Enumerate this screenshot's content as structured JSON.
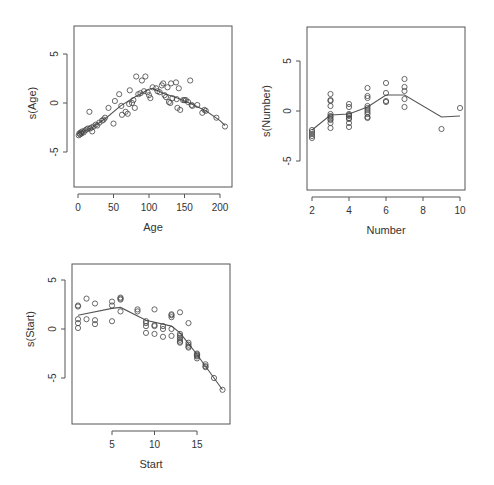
{
  "figure": {
    "title": "",
    "layout": "2x2 grid of GAM partial-effect plots (bottom-right panel empty)"
  },
  "chart_data": [
    {
      "type": "scatter",
      "panel": "top-left",
      "title": "",
      "xlabel": "Age",
      "ylabel": "s(Age)",
      "xlim": [
        -8,
        214
      ],
      "ylim": [
        -8.5,
        7.8
      ],
      "xticks": [
        0,
        50,
        100,
        150,
        200
      ],
      "xtick_labels": [
        "0",
        "50",
        "100",
        "150",
        "200"
      ],
      "yticks": [
        -5,
        0,
        5
      ],
      "ytick_labels": [
        "-5",
        "0",
        "5"
      ],
      "grid": false,
      "legend": null,
      "points": [
        [
          1,
          -3.3
        ],
        [
          2,
          -3.1
        ],
        [
          3,
          -3.2
        ],
        [
          4,
          -3.0
        ],
        [
          5,
          -3.1
        ],
        [
          6,
          -2.9
        ],
        [
          8,
          -3.0
        ],
        [
          10,
          -2.8
        ],
        [
          12,
          -2.7
        ],
        [
          14,
          -2.6
        ],
        [
          16,
          -0.9
        ],
        [
          17,
          -2.6
        ],
        [
          19,
          -2.5
        ],
        [
          20,
          -2.9
        ],
        [
          22,
          -2.4
        ],
        [
          25,
          -2.2
        ],
        [
          27,
          -2.3
        ],
        [
          30,
          -2.0
        ],
        [
          34,
          -1.8
        ],
        [
          36,
          -1.7
        ],
        [
          38,
          -1.5
        ],
        [
          43,
          -0.5
        ],
        [
          50,
          -2.1
        ],
        [
          52,
          0.2
        ],
        [
          58,
          0.9
        ],
        [
          61,
          -0.3
        ],
        [
          62,
          -1.2
        ],
        [
          67,
          -0.9
        ],
        [
          70,
          -1.1
        ],
        [
          72,
          -0.1
        ],
        [
          73,
          1.3
        ],
        [
          76,
          0.0
        ],
        [
          78,
          0.3
        ],
        [
          80,
          -0.5
        ],
        [
          82,
          2.7
        ],
        [
          85,
          0.9
        ],
        [
          88,
          1.0
        ],
        [
          90,
          2.3
        ],
        [
          93,
          1.2
        ],
        [
          95,
          2.7
        ],
        [
          98,
          1.1
        ],
        [
          100,
          0.8
        ],
        [
          102,
          0.5
        ],
        [
          105,
          1.6
        ],
        [
          110,
          1.5
        ],
        [
          112,
          1.2
        ],
        [
          115,
          1.1
        ],
        [
          118,
          1.8
        ],
        [
          120,
          2.0
        ],
        [
          122,
          0.8
        ],
        [
          124,
          0.6
        ],
        [
          126,
          1.6
        ],
        [
          128,
          0.1
        ],
        [
          130,
          0.0
        ],
        [
          131,
          2.0
        ],
        [
          133,
          0.5
        ],
        [
          138,
          2.1
        ],
        [
          139,
          0.4
        ],
        [
          140,
          -0.5
        ],
        [
          142,
          1.5
        ],
        [
          144,
          -0.7
        ],
        [
          148,
          0.3
        ],
        [
          150,
          0.3
        ],
        [
          152,
          0.3
        ],
        [
          155,
          0.1
        ],
        [
          158,
          2.3
        ],
        [
          160,
          -0.2
        ],
        [
          161,
          -0.3
        ],
        [
          168,
          -0.2
        ],
        [
          175,
          -1.0
        ],
        [
          178,
          -0.7
        ],
        [
          180,
          -0.8
        ],
        [
          195,
          -1.5
        ],
        [
          207,
          -2.4
        ]
      ],
      "smooth_curve": {
        "x": [
          0,
          20,
          40,
          60,
          80,
          100,
          105,
          120,
          140,
          160,
          180,
          200,
          207
        ],
        "y": [
          -3.1,
          -2.5,
          -1.5,
          -0.3,
          0.6,
          1.4,
          1.5,
          1.0,
          0.5,
          -0.1,
          -0.8,
          -1.8,
          -2.3
        ]
      }
    },
    {
      "type": "scatter",
      "panel": "top-right",
      "title": "",
      "xlabel": "Number",
      "ylabel": "s(Number)",
      "xlim": [
        1.7,
        10.3
      ],
      "ylim": [
        -8.0,
        8.2
      ],
      "xticks": [
        2,
        4,
        6,
        8,
        10
      ],
      "xtick_labels": [
        "2",
        "4",
        "6",
        "8",
        "10"
      ],
      "yticks": [
        -5,
        0,
        5
      ],
      "ytick_labels": [
        "-5",
        "0",
        "5"
      ],
      "grid": false,
      "legend": null,
      "points": [
        [
          2,
          -1.9
        ],
        [
          2,
          -2.1
        ],
        [
          2,
          -2.3
        ],
        [
          2,
          -2.5
        ],
        [
          2,
          -2.7
        ],
        [
          3,
          1.7
        ],
        [
          3,
          1.1
        ],
        [
          3,
          1.0
        ],
        [
          3,
          0.5
        ],
        [
          3,
          -0.3
        ],
        [
          3,
          -0.5
        ],
        [
          3,
          -0.6
        ],
        [
          3,
          -0.8
        ],
        [
          3,
          -0.9
        ],
        [
          3,
          -1.2
        ],
        [
          3,
          -1.7
        ],
        [
          4,
          0.7
        ],
        [
          4,
          0.4
        ],
        [
          4,
          -0.3
        ],
        [
          4,
          -0.4
        ],
        [
          4,
          -0.5
        ],
        [
          4,
          -0.7
        ],
        [
          4,
          -0.8
        ],
        [
          4,
          -1.2
        ],
        [
          4,
          -1.6
        ],
        [
          5,
          2.3
        ],
        [
          5,
          1.5
        ],
        [
          5,
          1.3
        ],
        [
          5,
          0.5
        ],
        [
          5,
          0.3
        ],
        [
          5,
          0.1
        ],
        [
          5,
          -0.1
        ],
        [
          5,
          -0.3
        ],
        [
          5,
          -0.6
        ],
        [
          5,
          -0.7
        ],
        [
          6,
          2.8
        ],
        [
          6,
          1.8
        ],
        [
          6,
          1.0
        ],
        [
          6,
          0.9
        ],
        [
          7,
          3.2
        ],
        [
          7,
          2.4
        ],
        [
          7,
          2.0
        ],
        [
          7,
          1.2
        ],
        [
          7,
          0.4
        ],
        [
          9,
          -1.8
        ],
        [
          10,
          0.3
        ]
      ],
      "smooth_curve": {
        "x": [
          2,
          3,
          4,
          5,
          6,
          7,
          9,
          10
        ],
        "y": [
          -1.9,
          -0.4,
          -0.3,
          0.4,
          1.6,
          1.6,
          -0.6,
          -0.5
        ]
      }
    },
    {
      "type": "scatter",
      "panel": "bottom-left",
      "title": "",
      "xlabel": "Start",
      "ylabel": "s(Start)",
      "xlim": [
        0.3,
        19.0
      ],
      "ylim": [
        -9.6,
        6.6
      ],
      "xticks": [
        5,
        10,
        15
      ],
      "xtick_labels": [
        "5",
        "10",
        "15"
      ],
      "yticks": [
        -5,
        0,
        5
      ],
      "ytick_labels": [
        "-5",
        "0",
        "5"
      ],
      "grid": false,
      "legend": null,
      "points": [
        [
          1,
          2.4
        ],
        [
          1,
          2.3
        ],
        [
          1,
          1.0
        ],
        [
          1,
          0.6
        ],
        [
          1,
          0.1
        ],
        [
          2,
          3.1
        ],
        [
          2,
          1.0
        ],
        [
          3,
          2.6
        ],
        [
          3,
          0.9
        ],
        [
          3,
          0.5
        ],
        [
          5,
          2.8
        ],
        [
          5,
          2.4
        ],
        [
          5,
          0.8
        ],
        [
          6,
          3.2
        ],
        [
          6,
          3.1
        ],
        [
          6,
          3.0
        ],
        [
          6,
          1.8
        ],
        [
          8,
          2.0
        ],
        [
          8,
          1.8
        ],
        [
          9,
          0.8
        ],
        [
          9,
          0.6
        ],
        [
          9,
          0.3
        ],
        [
          9,
          -0.4
        ],
        [
          10,
          2.0
        ],
        [
          10,
          0.4
        ],
        [
          10,
          0.3
        ],
        [
          10,
          -0.5
        ],
        [
          11,
          0.3
        ],
        [
          11,
          0.0
        ],
        [
          11,
          -0.8
        ],
        [
          12,
          1.5
        ],
        [
          12,
          1.4
        ],
        [
          12,
          1.2
        ],
        [
          12,
          0.0
        ],
        [
          12,
          -0.7
        ],
        [
          13,
          1.7
        ],
        [
          13,
          -0.5
        ],
        [
          13,
          -0.7
        ],
        [
          13,
          -0.9
        ],
        [
          13,
          -1.1
        ],
        [
          13,
          -1.3
        ],
        [
          13,
          -1.4
        ],
        [
          14,
          0.6
        ],
        [
          14,
          -1.4
        ],
        [
          14,
          -1.6
        ],
        [
          14,
          -1.8
        ],
        [
          14,
          -1.9
        ],
        [
          15,
          -2.5
        ],
        [
          15,
          -2.6
        ],
        [
          15,
          -2.7
        ],
        [
          15,
          -2.8
        ],
        [
          15,
          -3.0
        ],
        [
          16,
          -3.6
        ],
        [
          16,
          -3.8
        ],
        [
          16,
          -3.9
        ],
        [
          17,
          -5.0
        ],
        [
          18,
          -6.2
        ]
      ],
      "smooth_curve": {
        "x": [
          1,
          5,
          6,
          9,
          12,
          13,
          14,
          15,
          16,
          17,
          18
        ],
        "y": [
          1.4,
          2.1,
          2.2,
          0.9,
          0.3,
          -0.4,
          -1.5,
          -2.6,
          -3.8,
          -5.0,
          -6.2
        ]
      }
    }
  ]
}
